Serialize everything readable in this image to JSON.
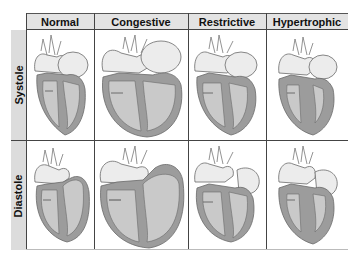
{
  "columns": [
    {
      "label": "Normal"
    },
    {
      "label": "Congestive"
    },
    {
      "label": "Restrictive"
    },
    {
      "label": "Hypertrophic"
    }
  ],
  "rows": [
    {
      "label": "Systole"
    },
    {
      "label": "Diastole"
    }
  ],
  "colors": {
    "muscle": "#9c9c9c",
    "chamber": "#c9c9c9",
    "vessel": "#ececec",
    "outline": "#6a6a6a",
    "header_bg": "#e3e3e3",
    "side_bg": "#dcdcdc",
    "grid_line": "#444444"
  }
}
